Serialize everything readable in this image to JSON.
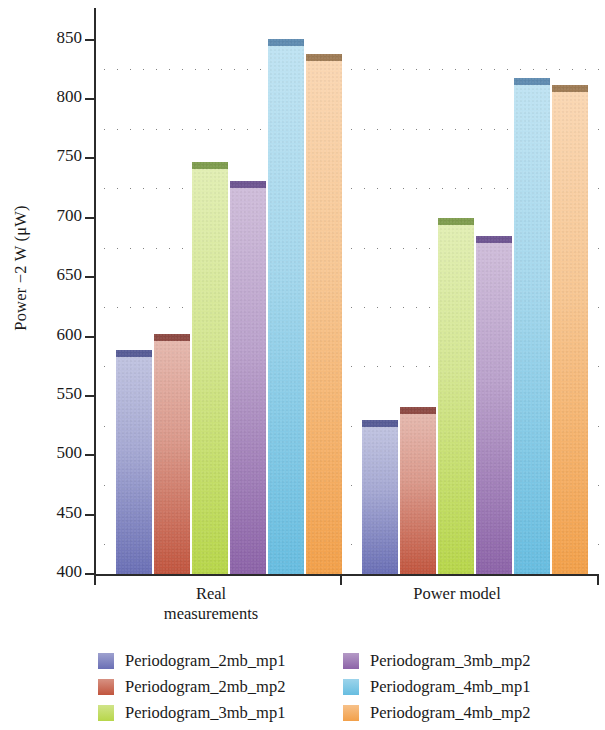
{
  "chart_data": {
    "type": "bar",
    "title": "",
    "xlabel": "",
    "ylabel": "Power −2 W (μW)",
    "ylim": [
      400,
      870
    ],
    "yticks": [
      400,
      450,
      500,
      550,
      600,
      650,
      700,
      750,
      800,
      850
    ],
    "ytick_labels": [
      "400",
      "450",
      "500",
      "550",
      "600",
      "650",
      "700",
      "750",
      "800",
      "850"
    ],
    "grid": "horizontal-dotted",
    "legend_position": "below-plot-two-columns",
    "categories": [
      "Real measurements",
      "Power model"
    ],
    "category_lines": [
      [
        "Real",
        "measurements"
      ],
      [
        "Power model"
      ]
    ],
    "series": [
      {
        "name": "Periodogram_2mb_mp1",
        "color": "#6a6fb5",
        "cap_color": "#575c96",
        "values": [
          589,
          530
        ]
      },
      {
        "name": "Periodogram_2mb_mp2",
        "color": "#c1553e",
        "cap_color": "#8d4a43",
        "values": [
          602,
          541
        ]
      },
      {
        "name": "Periodogram_3mb_mp1",
        "color": "#b7d64a",
        "cap_color": "#7e9c4e",
        "values": [
          747,
          700
        ]
      },
      {
        "name": "Periodogram_3mb_mp2",
        "color": "#8c63a8",
        "cap_color": "#6e5591",
        "values": [
          731,
          685
        ]
      },
      {
        "name": "Periodogram_4mb_mp1",
        "color": "#67bde0",
        "cap_color": "#5f8bb0",
        "values": [
          851,
          818
        ]
      },
      {
        "name": "Periodogram_4mb_mp2",
        "color": "#f2a04a",
        "cap_color": "#9e7b55",
        "values": [
          838,
          812
        ]
      }
    ]
  },
  "legend": {
    "columns": [
      [
        "Periodogram_2mb_mp1",
        "Periodogram_2mb_mp2",
        "Periodogram_3mb_mp1"
      ],
      [
        "Periodogram_3mb_mp2",
        "Periodogram_4mb_mp1",
        "Periodogram_4mb_mp2"
      ]
    ]
  }
}
